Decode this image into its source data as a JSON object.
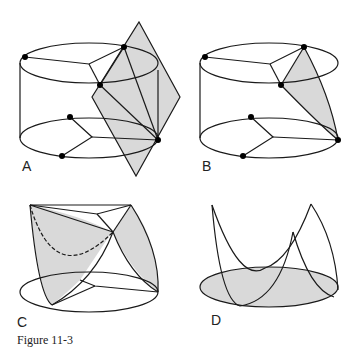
{
  "figure": {
    "caption": "Figure 11-3",
    "panels": [
      {
        "id": "A",
        "label": "A"
      },
      {
        "id": "B",
        "label": "B"
      },
      {
        "id": "C",
        "label": "C"
      },
      {
        "id": "D",
        "label": "D"
      }
    ]
  },
  "colors": {
    "stroke": "#1a1a1a",
    "fill": "#d9d9d9",
    "background": "#ffffff"
  }
}
